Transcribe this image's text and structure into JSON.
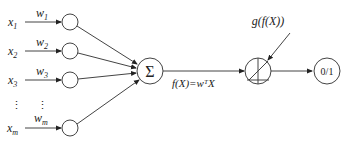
{
  "diagram": {
    "type": "perceptron",
    "inputs": [
      {
        "label": "x",
        "sub": "1",
        "weight": "w",
        "weight_sub": "1"
      },
      {
        "label": "x",
        "sub": "2",
        "weight": "w",
        "weight_sub": "2"
      },
      {
        "label": "x",
        "sub": "3",
        "weight": "w",
        "weight_sub": "3"
      },
      {
        "label": "x",
        "sub": "m",
        "weight": "w",
        "weight_sub": "m"
      }
    ],
    "ellipsis": "⋮",
    "sum_symbol": "Σ",
    "sum_output_label": "f(X)=wᵀX",
    "activation_label": "g(f(X))",
    "output_label": "0/1"
  }
}
